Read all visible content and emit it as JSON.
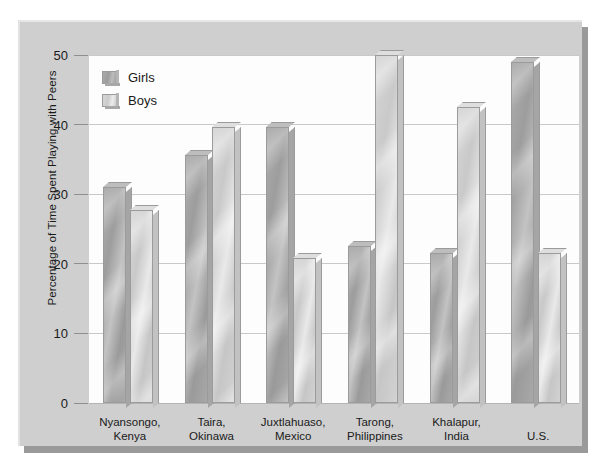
{
  "chart_data": {
    "type": "bar",
    "title": "",
    "xlabel": "",
    "ylabel": "Percentage of Time Spent Playing with Peers",
    "ylim": [
      0,
      50
    ],
    "yticks": [
      0,
      10,
      20,
      30,
      40,
      50
    ],
    "ytick_labels": [
      "0",
      "10",
      "20",
      "30",
      "40",
      "50"
    ],
    "grid": true,
    "legend_position": "top-left",
    "categories": [
      "Nyansongo,\nKenya",
      "Taira,\nOkinawa",
      "Juxtlahuaso,\nMexico",
      "Tarong,\nPhilippines",
      "Khalapur,\nIndia",
      "U.S."
    ],
    "series": [
      {
        "name": "Girls",
        "color": "#a8a8a8",
        "values": [
          31,
          35.7,
          39.7,
          22.6,
          21.6,
          49
        ]
      },
      {
        "name": "Boys",
        "color": "#d4d4d4",
        "values": [
          27.7,
          39.6,
          20.8,
          50,
          42.5,
          21.6
        ]
      }
    ]
  },
  "axis": {
    "ylabel": "Percentage of Time Spent Playing with Peers",
    "ticks": [
      {
        "label": "50",
        "value": 50
      },
      {
        "label": "40",
        "value": 40
      },
      {
        "label": "30",
        "value": 30
      },
      {
        "label": "20",
        "value": 20
      },
      {
        "label": "10",
        "value": 10
      },
      {
        "label": "0",
        "value": 0
      }
    ]
  },
  "legend": {
    "items": [
      {
        "label": "Girls",
        "swatch": "girls"
      },
      {
        "label": "Boys",
        "swatch": "boys"
      }
    ]
  },
  "categories": [
    {
      "line1": "Nyansongo,",
      "line2": "Kenya"
    },
    {
      "line1": "Taira,",
      "line2": "Okinawa"
    },
    {
      "line1": "Juxtlahuaso,",
      "line2": "Mexico"
    },
    {
      "line1": "Tarong,",
      "line2": "Philippines"
    },
    {
      "line1": "Khalapur,",
      "line2": "India"
    },
    {
      "line1": "U.S.",
      "line2": ""
    }
  ],
  "colors": {
    "panel_background": "#cfcfcf",
    "plot_background": "#fdfdfd",
    "gridline": "#c9c9c9",
    "girls_bar": "#a8a8a8",
    "boys_bar": "#d4d4d4",
    "bar_outline": "#9b9b9b",
    "text": "#1a1a1a",
    "panel_shadow": "#9a9a9a"
  }
}
